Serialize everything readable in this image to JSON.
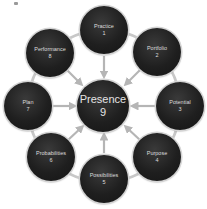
{
  "diagram": {
    "type": "hub-and-spoke cycle",
    "colors": {
      "node_fill": "#1f1f1f",
      "node_text": "#dcdcdc",
      "connector": "#b5b5b5",
      "ring": "#c8c8c8",
      "background": "#ffffff"
    },
    "center": {
      "label": "Presence",
      "number": "9"
    },
    "nodes": [
      {
        "label": "Practice",
        "number": "1"
      },
      {
        "label": "Portfolio",
        "number": "2"
      },
      {
        "label": "Potential",
        "number": "3"
      },
      {
        "label": "Purpose",
        "number": "4"
      },
      {
        "label": "Possibilities",
        "number": "5"
      },
      {
        "label": "Probabilities",
        "number": "6"
      },
      {
        "label": "Plan",
        "number": "7"
      },
      {
        "label": "Performance",
        "number": "8"
      }
    ],
    "arrows_direction": "outer-to-center"
  }
}
